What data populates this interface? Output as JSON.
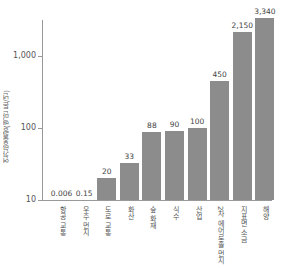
{
  "chart_data": {
    "type": "bar",
    "title": "",
    "xlabel": "",
    "ylabel": "연간방출량(백만 톤/년)",
    "yscale": "log",
    "ylim": [
      10,
      4000
    ],
    "yticks": [
      "1,000",
      "100",
      "10"
    ],
    "categories": [
      "항공 교통",
      "우주 먼지",
      "도로 교통",
      "화산",
      "숲 화재",
      "식수",
      "산업",
      "2차 에어로졸 먼지",
      "지표면 소금",
      "해양"
    ],
    "values": [
      0.006,
      0.15,
      20,
      33,
      88,
      90,
      100,
      450,
      2150,
      3340
    ],
    "value_labels": [
      "0.006",
      "0.15",
      "20",
      "33",
      "88",
      "90",
      "100",
      "450",
      "2,150",
      "3,340"
    ],
    "bar_color": "#8c8c8c"
  }
}
